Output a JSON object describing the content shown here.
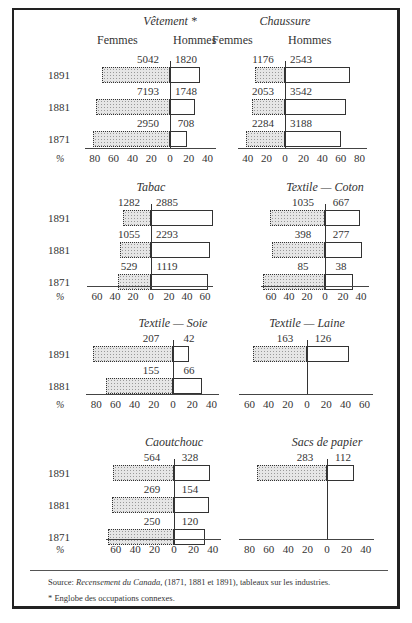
{
  "chart_data": [
    {
      "type": "bar",
      "orientation": "horizontal-diverging",
      "title": "Vêtement *",
      "headers": {
        "left": "Femmes",
        "right": "Hommes"
      },
      "categories": [
        "1891",
        "1881",
        "1871"
      ],
      "series": [
        {
          "name": "Femmes",
          "counts": [
            5042,
            7193,
            2950
          ],
          "percent": [
            72,
            79,
            82
          ]
        },
        {
          "name": "Hommes",
          "counts": [
            1820,
            1748,
            708
          ],
          "percent": [
            32,
            27,
            18
          ]
        }
      ],
      "xlabel": "%",
      "left_ticks": [
        "80",
        "60",
        "40",
        "20",
        "0"
      ],
      "right_ticks": [
        "20",
        "40"
      ],
      "xlim": [
        -80,
        40
      ]
    },
    {
      "type": "bar",
      "orientation": "horizontal-diverging",
      "title": "Chaussure",
      "headers": {
        "left": "Femmes",
        "right": "Hommes"
      },
      "categories": [
        "1891",
        "1881",
        "1871"
      ],
      "series": [
        {
          "name": "Femmes",
          "counts": [
            1176,
            2053,
            2284
          ],
          "percent": [
            32,
            36,
            42
          ]
        },
        {
          "name": "Hommes",
          "counts": [
            2543,
            3542,
            3188
          ],
          "percent": [
            70,
            66,
            60
          ]
        }
      ],
      "xlabel": "%",
      "left_ticks": [
        "40",
        "20",
        "0"
      ],
      "right_ticks": [
        "20",
        "40",
        "60",
        "80"
      ],
      "xlim": [
        -40,
        80
      ]
    },
    {
      "type": "bar",
      "orientation": "horizontal-diverging",
      "title": "Tabac",
      "categories": [
        "1891",
        "1881",
        "1871"
      ],
      "series": [
        {
          "name": "Femmes",
          "counts": [
            1282,
            1055,
            529
          ],
          "percent": [
            31,
            34,
            37
          ]
        },
        {
          "name": "Hommes",
          "counts": [
            2885,
            2293,
            1119
          ],
          "percent": [
            69,
            66,
            63
          ]
        }
      ],
      "xlabel": "%",
      "left_ticks": [
        "60",
        "40",
        "20",
        "0"
      ],
      "right_ticks": [
        "20",
        "40",
        "60"
      ],
      "xlim": [
        -60,
        60
      ]
    },
    {
      "type": "bar",
      "orientation": "horizontal-diverging",
      "title": "Textile — Coton",
      "categories": [
        "1891",
        "1881",
        "1871"
      ],
      "series": [
        {
          "name": "Femmes",
          "counts": [
            1035,
            398,
            85
          ],
          "percent": [
            61,
            59,
            69
          ]
        },
        {
          "name": "Hommes",
          "counts": [
            667,
            277,
            38
          ],
          "percent": [
            39,
            41,
            31
          ]
        }
      ],
      "xlabel": "%",
      "left_ticks": [
        "60",
        "40",
        "20",
        "0"
      ],
      "right_ticks": [
        "20",
        "40"
      ],
      "xlim": [
        -70,
        40
      ]
    },
    {
      "type": "bar",
      "orientation": "horizontal-diverging",
      "title": "Textile — Soie",
      "categories": [
        "1891",
        "1881"
      ],
      "series": [
        {
          "name": "Femmes",
          "counts": [
            207,
            155
          ],
          "percent": [
            83,
            70
          ]
        },
        {
          "name": "Hommes",
          "counts": [
            42,
            66
          ],
          "percent": [
            17,
            30
          ]
        }
      ],
      "xlabel": "%",
      "left_ticks": [
        "80",
        "60",
        "40",
        "20",
        "0"
      ],
      "right_ticks": [
        "20",
        "40"
      ],
      "xlim": [
        -80,
        40
      ]
    },
    {
      "type": "bar",
      "orientation": "horizontal-diverging",
      "title": "Textile — Laine",
      "categories": [
        "1891"
      ],
      "series": [
        {
          "name": "Femmes",
          "counts": [
            163
          ],
          "percent": [
            56
          ]
        },
        {
          "name": "Hommes",
          "counts": [
            126
          ],
          "percent": [
            44
          ]
        }
      ],
      "xlabel": "%",
      "left_ticks": [
        "60",
        "40",
        "20",
        "0"
      ],
      "right_ticks": [
        "20",
        "40",
        "60"
      ],
      "xlim": [
        -60,
        60
      ]
    },
    {
      "type": "bar",
      "orientation": "horizontal-diverging",
      "title": "Caoutchouc",
      "categories": [
        "1891",
        "1881",
        "1871"
      ],
      "series": [
        {
          "name": "Femmes",
          "counts": [
            564,
            269,
            250
          ],
          "percent": [
            63,
            64,
            68
          ]
        },
        {
          "name": "Hommes",
          "counts": [
            328,
            154,
            120
          ],
          "percent": [
            37,
            36,
            32
          ]
        }
      ],
      "xlabel": "%",
      "left_ticks": [
        "60",
        "40",
        "20",
        "0"
      ],
      "right_ticks": [
        "20",
        "40"
      ],
      "xlim": [
        -70,
        40
      ]
    },
    {
      "type": "bar",
      "orientation": "horizontal-diverging",
      "title": "Sacs de papier",
      "categories": [
        "1891"
      ],
      "series": [
        {
          "name": "Femmes",
          "counts": [
            283
          ],
          "percent": [
            72
          ]
        },
        {
          "name": "Hommes",
          "counts": [
            112
          ],
          "percent": [
            28
          ]
        }
      ],
      "xlabel": "%",
      "left_ticks": [
        "80",
        "60",
        "40",
        "20",
        "0"
      ],
      "right_ticks": [
        "20",
        "40"
      ],
      "xlim": [
        -80,
        40
      ]
    }
  ],
  "layout": {
    "panels": [
      {
        "zero_x": 170,
        "title_y": 14,
        "header_y": 33,
        "row_top": 53,
        "rows": 3,
        "axis_y": 148,
        "scale": 0.94,
        "year_x": 48,
        "show_years": true,
        "show_headers": true
      },
      {
        "zero_x": 285,
        "title_y": 14,
        "header_y": 33,
        "row_top": 53,
        "rows": 3,
        "axis_y": 148,
        "scale": 0.93,
        "year_x": null,
        "show_years": false,
        "show_headers": true
      },
      {
        "zero_x": 151,
        "title_y": 180,
        "header_y": null,
        "row_top": 196,
        "rows": 3,
        "axis_y": 286,
        "scale": 0.9,
        "year_x": 48,
        "show_years": true,
        "show_headers": false
      },
      {
        "zero_x": 325,
        "title_y": 180,
        "header_y": null,
        "row_top": 196,
        "rows": 3,
        "axis_y": 286,
        "scale": 0.9,
        "year_x": null,
        "show_years": false,
        "show_headers": false
      },
      {
        "zero_x": 173,
        "title_y": 316,
        "header_y": null,
        "row_top": 332,
        "rows": 2,
        "axis_y": 394,
        "scale": 0.96,
        "year_x": 48,
        "show_years": true,
        "show_headers": false
      },
      {
        "zero_x": 307,
        "title_y": 316,
        "header_y": null,
        "row_top": 332,
        "rows": 1,
        "axis_y": 394,
        "scale": 0.96,
        "year_x": null,
        "show_years": false,
        "show_headers": false
      },
      {
        "zero_x": 174,
        "title_y": 435,
        "header_y": null,
        "row_top": 451,
        "rows": 3,
        "axis_y": 539,
        "scale": 0.97,
        "year_x": 48,
        "show_years": true,
        "show_headers": false
      },
      {
        "zero_x": 327,
        "title_y": 435,
        "header_y": null,
        "row_top": 451,
        "rows": 1,
        "axis_y": 539,
        "scale": 0.97,
        "year_x": null,
        "show_years": false,
        "show_headers": false
      }
    ]
  },
  "footer": {
    "source_label": "Source: ",
    "source_title": "Recensement du Canada",
    "source_rest": ", (1871, 1881 et 1891), tableaux sur les industries.",
    "note": "*  Englobe des occupations connexes."
  },
  "colors": {
    "border": "#222222",
    "female_fill": "#e6e6e6",
    "male_fill": "#ffffff",
    "text": "#333333"
  }
}
